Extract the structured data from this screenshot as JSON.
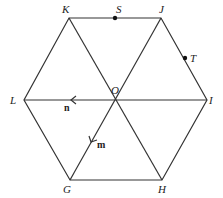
{
  "diagram": {
    "vertices": [
      {
        "name": "K",
        "x": 69,
        "y": 18,
        "lx": 62,
        "ly": 13
      },
      {
        "name": "J",
        "x": 161,
        "y": 18,
        "lx": 159,
        "ly": 13
      },
      {
        "name": "I",
        "x": 207,
        "y": 100,
        "lx": 209,
        "ly": 104
      },
      {
        "name": "H",
        "x": 162,
        "y": 180,
        "lx": 158,
        "ly": 193
      },
      {
        "name": "G",
        "x": 70,
        "y": 180,
        "lx": 63,
        "ly": 193
      },
      {
        "name": "L",
        "x": 24,
        "y": 100,
        "lx": 10,
        "ly": 104
      },
      {
        "name": "O",
        "x": 115,
        "y": 100,
        "lx": 111,
        "ly": 94
      }
    ],
    "points": [
      {
        "name": "S",
        "x": 115,
        "y": 18,
        "lx": 116,
        "ly": 13
      },
      {
        "name": "T",
        "x": 185,
        "y": 58,
        "lx": 190,
        "ly": 62
      }
    ],
    "vectors": [
      {
        "name": "n",
        "from": "O",
        "to": "L",
        "lx": 64,
        "ly": 111
      },
      {
        "name": "m",
        "from": "O",
        "to": "G",
        "lx": 97,
        "ly": 148
      }
    ]
  }
}
